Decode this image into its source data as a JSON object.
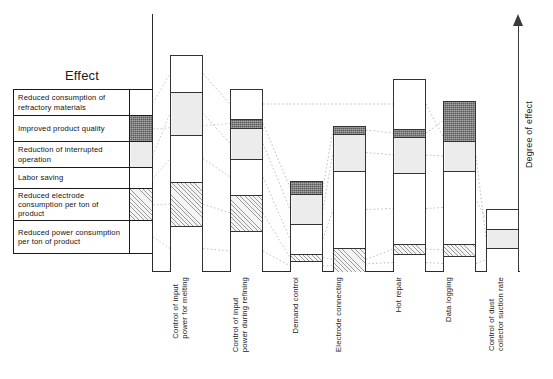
{
  "legend": {
    "title": "Effect",
    "rows": [
      {
        "label": "Reduced consumption of refractory materials",
        "swatch": "white"
      },
      {
        "label": "Improved product quality",
        "swatch": "dark"
      },
      {
        "label": "Reduction of interrupted operation",
        "swatch": "lightgray"
      },
      {
        "label": "Labor saving",
        "swatch": "white"
      },
      {
        "label": "Reduced electrode consumption per ton of product",
        "swatch": "hatch"
      },
      {
        "label": "Reduced power consumption per ton of product",
        "swatch": "white"
      }
    ]
  },
  "axis": {
    "right_label": "Degree of effect"
  },
  "chart_data": {
    "type": "bar",
    "title": "",
    "xlabel": "",
    "ylabel": "Degree of effect",
    "stacked": true,
    "grid": false,
    "legend_position": "left-table",
    "effect_categories": [
      "Reduced consumption of refractory materials",
      "Improved product quality",
      "Reduction of interrupted operation",
      "Labor saving",
      "Reduced electrode consumption per ton of product",
      "Reduced power consumption per ton of product"
    ],
    "fill_styles": [
      "white",
      "dark",
      "lightgray",
      "white",
      "hatch",
      "white"
    ],
    "categories": [
      "Control of input power for melting",
      "Control of input power during refining",
      "Demand control",
      "Electrode connecting",
      "Hot repair",
      "Data logging",
      "Control of dust collector suction rate"
    ],
    "totals": [
      216,
      182,
      90,
      145,
      192,
      170,
      62
    ],
    "series": [
      {
        "name": "Control of input power for melting",
        "segments": [
          {
            "effect": "Reduced consumption of refractory materials",
            "fill": "white",
            "value": 37
          },
          {
            "effect": "Reduction of interrupted operation",
            "fill": "lightgray",
            "value": 43
          },
          {
            "effect": "Labor saving",
            "fill": "white",
            "value": 47
          },
          {
            "effect": "Reduced electrode consumption per ton of product",
            "fill": "hatch",
            "value": 44
          },
          {
            "effect": "Reduced power consumption per ton of product",
            "fill": "white",
            "value": 45
          }
        ]
      },
      {
        "name": "Control of input power during refining",
        "segments": [
          {
            "effect": "Reduced consumption of refractory materials",
            "fill": "white",
            "value": 30
          },
          {
            "effect": "Improved product quality",
            "fill": "dark",
            "value": 9
          },
          {
            "effect": "Reduction of interrupted operation",
            "fill": "lightgray",
            "value": 31
          },
          {
            "effect": "Labor saving",
            "fill": "white",
            "value": 36
          },
          {
            "effect": "Reduced electrode consumption per ton of product",
            "fill": "hatch",
            "value": 36
          },
          {
            "effect": "Reduced power consumption per ton of product",
            "fill": "white",
            "value": 40
          }
        ]
      },
      {
        "name": "Demand control",
        "segments": [
          {
            "effect": "Improved product quality",
            "fill": "dark",
            "value": 13
          },
          {
            "effect": "Reduction of interrupted operation",
            "fill": "lightgray",
            "value": 30
          },
          {
            "effect": "Labor saving",
            "fill": "white",
            "value": 30
          },
          {
            "effect": "Reduced electrode consumption per ton of product",
            "fill": "hatch",
            "value": 7
          },
          {
            "effect": "Reduced power consumption per ton of product",
            "fill": "white",
            "value": 10
          }
        ]
      },
      {
        "name": "Electrode connecting",
        "segments": [
          {
            "effect": "Improved product quality",
            "fill": "dark",
            "value": 8
          },
          {
            "effect": "Reduction of interrupted operation",
            "fill": "lightgray",
            "value": 37
          },
          {
            "effect": "Labor saving",
            "fill": "white",
            "value": 77
          },
          {
            "effect": "Reduced electrode consumption per ton of product",
            "fill": "hatch",
            "value": 23
          }
        ]
      },
      {
        "name": "Hot repair",
        "segments": [
          {
            "effect": "Reduced consumption of refractory materials",
            "fill": "white",
            "value": 50
          },
          {
            "effect": "Improved product quality",
            "fill": "dark",
            "value": 8
          },
          {
            "effect": "Reduction of interrupted operation",
            "fill": "lightgray",
            "value": 36
          },
          {
            "effect": "Labor saving",
            "fill": "white",
            "value": 71
          },
          {
            "effect": "Reduced electrode consumption per ton of product",
            "fill": "hatch",
            "value": 10
          },
          {
            "effect": "Reduced power consumption per ton of product",
            "fill": "white",
            "value": 17
          }
        ]
      },
      {
        "name": "Data logging",
        "segments": [
          {
            "effect": "Improved product quality",
            "fill": "dark",
            "value": 40
          },
          {
            "effect": "Reduction of interrupted operation",
            "fill": "lightgray",
            "value": 30
          },
          {
            "effect": "Labor saving",
            "fill": "white",
            "value": 73
          },
          {
            "effect": "Reduced electrode consumption per ton of product",
            "fill": "hatch",
            "value": 12
          },
          {
            "effect": "Reduced power consumption per ton of product",
            "fill": "white",
            "value": 15
          }
        ]
      },
      {
        "name": "Control of dust collector suction rate",
        "segments": [
          {
            "effect": "Reduced consumption of refractory materials",
            "fill": "white",
            "value": 20
          },
          {
            "effect": "Reduction of interrupted operation",
            "fill": "lightgray",
            "value": 19
          },
          {
            "effect": "Reduced power consumption per ton of product",
            "fill": "white",
            "value": 23
          }
        ]
      }
    ]
  }
}
